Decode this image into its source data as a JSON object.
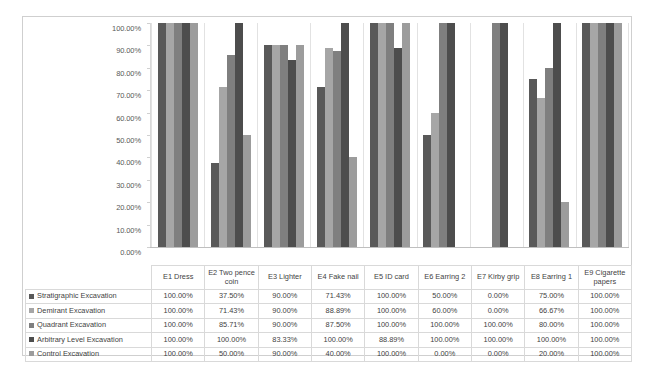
{
  "chart_data": {
    "type": "bar",
    "title": "",
    "subtitle": "",
    "xlabel": "",
    "ylabel": "",
    "ylim": [
      0,
      100
    ],
    "grid": false,
    "legend_position": "data-table",
    "y_ticks": [
      "0.00%",
      "10.00%",
      "20.00%",
      "30.00%",
      "40.00%",
      "50.00%",
      "60.00%",
      "70.00%",
      "80.00%",
      "90.00%",
      "100.00%"
    ],
    "categories": [
      "E1 Dress",
      "E2 Two pence coin",
      "E3 Lighter",
      "E4 Fake nail",
      "E5 ID card",
      "E6 Earring 2",
      "E7 Kirby grip",
      "E8 Earring 1",
      "E9 Cigarette papers"
    ],
    "series": [
      {
        "name": "Stratigraphic Excavation",
        "color": "#595959",
        "values": [
          100.0,
          37.5,
          90.0,
          71.43,
          100.0,
          50.0,
          0.0,
          75.0,
          100.0
        ],
        "labels": [
          "100.00%",
          "37.50%",
          "90.00%",
          "71.43%",
          "100.00%",
          "50.00%",
          "0.00%",
          "75.00%",
          "100.00%"
        ]
      },
      {
        "name": "Demirant Excavation",
        "color": "#a6a6a6",
        "values": [
          100.0,
          71.43,
          90.0,
          88.89,
          100.0,
          60.0,
          0.0,
          66.67,
          100.0
        ],
        "labels": [
          "100.00%",
          "71.43%",
          "90.00%",
          "88.89%",
          "100.00%",
          "60.00%",
          "0.00%",
          "66.67%",
          "100.00%"
        ]
      },
      {
        "name": "Quadrant Excavation",
        "color": "#7f7f7f",
        "values": [
          100.0,
          85.71,
          90.0,
          87.5,
          100.0,
          100.0,
          100.0,
          80.0,
          100.0
        ],
        "labels": [
          "100.00%",
          "85.71%",
          "90.00%",
          "87.50%",
          "100.00%",
          "100.00%",
          "100.00%",
          "80.00%",
          "100.00%"
        ]
      },
      {
        "name": "Arbitrary Level Excavation",
        "color": "#4d4d4d",
        "values": [
          100.0,
          100.0,
          83.33,
          100.0,
          88.89,
          100.0,
          100.0,
          100.0,
          100.0
        ],
        "labels": [
          "100.00%",
          "100.00%",
          "83.33%",
          "100.00%",
          "88.89%",
          "100.00%",
          "100.00%",
          "100.00%",
          "100.00%"
        ]
      },
      {
        "name": "Control Excavation",
        "color": "#9c9c9c",
        "values": [
          100.0,
          50.0,
          90.0,
          40.0,
          100.0,
          0.0,
          0.0,
          20.0,
          100.0
        ],
        "labels": [
          "100.00%",
          "50.00%",
          "90.00%",
          "40.00%",
          "100.00%",
          "0.00%",
          "0.00%",
          "20.00%",
          "100.00%"
        ]
      }
    ]
  },
  "table": {
    "corner_label": "",
    "column_headers": [
      "E1 Dress",
      "E2 Two pence coin",
      "E3 Lighter",
      "E4 Fake nail",
      "E5 ID card",
      "E6 Earring 2",
      "E7 Kirby grip",
      "E8 Earring 1",
      "E9 Cigarette papers"
    ],
    "rows": [
      {
        "label": "Stratigraphic Excavation",
        "swatch": "#595959",
        "cells": [
          "100.00%",
          "37.50%",
          "90.00%",
          "71.43%",
          "100.00%",
          "50.00%",
          "0.00%",
          "75.00%",
          "100.00%"
        ]
      },
      {
        "label": "Demirant Excavation",
        "swatch": "#a6a6a6",
        "cells": [
          "100.00%",
          "71.43%",
          "90.00%",
          "88.89%",
          "100.00%",
          "60.00%",
          "0.00%",
          "66.67%",
          "100.00%"
        ]
      },
      {
        "label": "Quadrant Excavation",
        "swatch": "#7f7f7f",
        "cells": [
          "100.00%",
          "85.71%",
          "90.00%",
          "87.50%",
          "100.00%",
          "100.00%",
          "100.00%",
          "80.00%",
          "100.00%"
        ]
      },
      {
        "label": "Arbitrary Level Excavation",
        "swatch": "#4d4d4d",
        "cells": [
          "100.00%",
          "100.00%",
          "83.33%",
          "100.00%",
          "88.89%",
          "100.00%",
          "100.00%",
          "100.00%",
          "100.00%"
        ]
      },
      {
        "label": "Control Excavation",
        "swatch": "#9c9c9c",
        "cells": [
          "100.00%",
          "50.00%",
          "90.00%",
          "40.00%",
          "100.00%",
          "0.00%",
          "0.00%",
          "20.00%",
          "100.00%"
        ]
      }
    ]
  }
}
